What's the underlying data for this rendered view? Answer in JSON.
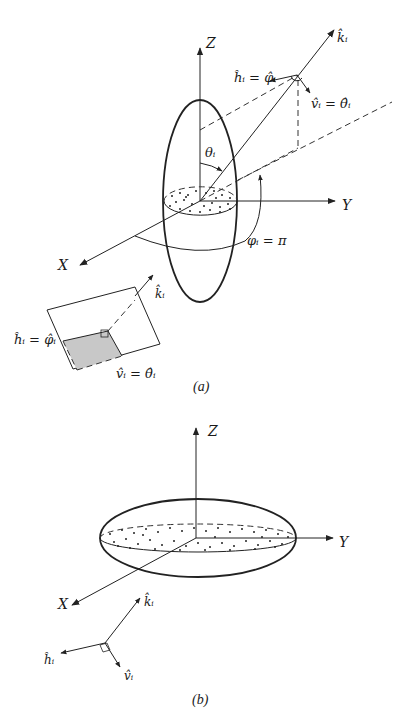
{
  "figure_a": {
    "caption": "(a)",
    "axes": {
      "z": "Z",
      "y": "Y",
      "x": "X"
    },
    "labels": {
      "k": "k̂ᵢ",
      "h_eq": "ĥᵢ = φ̂ᵢ",
      "v_eq": "v̂ᵢ = θ̂ᵢ",
      "theta": "θᵢ",
      "phi_eq": "φᵢ = π"
    },
    "inset": {
      "k": "k̂ᵢ",
      "h_eq": "ĥᵢ = φ̂ᵢ",
      "v_eq": "v̂ᵢ = θ̂ᵢ"
    }
  },
  "figure_b": {
    "caption": "(b)",
    "axes": {
      "z": "Z",
      "y": "Y",
      "x": "X"
    },
    "triad": {
      "k": "k̂ᵢ",
      "h": "ĥᵢ",
      "v": "v̂ᵢ"
    }
  },
  "colors": {
    "ink": "#222222",
    "shade": "#c8c8c8",
    "background": "#ffffff"
  }
}
